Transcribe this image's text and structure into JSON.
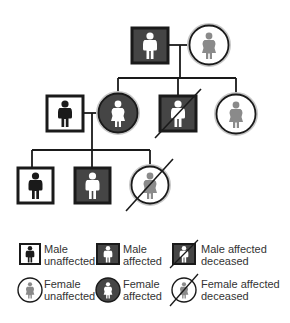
{
  "diagram": {
    "type": "pedigree-chart",
    "generations": [
      {
        "level": 1,
        "individuals": [
          {
            "id": "I-1",
            "sex": "male",
            "status": "affected",
            "deceased": false
          },
          {
            "id": "I-2",
            "sex": "female",
            "status": "unaffected",
            "deceased": false
          }
        ]
      },
      {
        "level": 2,
        "individuals": [
          {
            "id": "II-spouse",
            "sex": "male",
            "status": "unaffected",
            "deceased": false
          },
          {
            "id": "II-1",
            "sex": "female",
            "status": "affected",
            "deceased": false
          },
          {
            "id": "II-2",
            "sex": "male",
            "status": "affected",
            "deceased": true
          },
          {
            "id": "II-3",
            "sex": "female",
            "status": "unaffected",
            "deceased": false
          }
        ]
      },
      {
        "level": 3,
        "individuals": [
          {
            "id": "III-1",
            "sex": "male",
            "status": "unaffected",
            "deceased": false
          },
          {
            "id": "III-2",
            "sex": "male",
            "status": "affected",
            "deceased": false
          },
          {
            "id": "III-3",
            "sex": "female",
            "status": "affected",
            "deceased": true
          }
        ]
      }
    ]
  },
  "legend": {
    "items": [
      {
        "key": "male-unaffected",
        "line1": "Male",
        "line2": "unaffected"
      },
      {
        "key": "male-affected",
        "line1": "Male",
        "line2": "affected"
      },
      {
        "key": "male-affected-deceased",
        "line1": "Male affected",
        "line2": "deceased"
      },
      {
        "key": "female-unaffected",
        "line1": "Female",
        "line2": "unaffected"
      },
      {
        "key": "female-affected",
        "line1": "Female",
        "line2": "affected"
      },
      {
        "key": "female-affected-deceased",
        "line1": "Female affected",
        "line2": "deceased"
      }
    ]
  },
  "colors": {
    "stroke": "#1a1a1a",
    "affected_fill": "#454545",
    "unaffected_fill": "#ffffff",
    "figure_dark": "#1a1a1a",
    "figure_light": "#ffffff",
    "figure_gray": "#8a8a8a",
    "halo": "#bdbdbd"
  }
}
